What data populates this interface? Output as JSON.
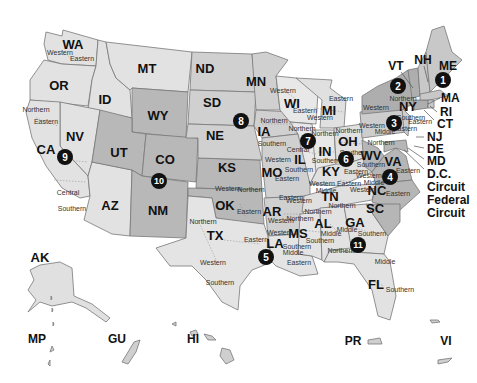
{
  "map": {
    "title": "United States Federal Judicial Circuits and Districts",
    "colors": {
      "background": "#ffffff",
      "light": "#e6e6e6",
      "medium": "#d2d2d2",
      "dark": "#b6b6b6",
      "circle": "#111111",
      "border": "#777777"
    },
    "circuits": [
      {
        "number": "1",
        "states": [
          "ME",
          "NH",
          "MA",
          "RI"
        ]
      },
      {
        "number": "2",
        "states": [
          "VT",
          "NY",
          "CT"
        ]
      },
      {
        "number": "3",
        "states": [
          "PA",
          "NJ",
          "DE"
        ]
      },
      {
        "number": "4",
        "states": [
          "MD",
          "WV",
          "VA",
          "NC",
          "SC"
        ]
      },
      {
        "number": "5",
        "states": [
          "TX",
          "LA",
          "MS"
        ]
      },
      {
        "number": "6",
        "states": [
          "MI",
          "OH",
          "KY",
          "TN"
        ]
      },
      {
        "number": "7",
        "states": [
          "WI",
          "IL",
          "IN"
        ]
      },
      {
        "number": "8",
        "states": [
          "ND",
          "SD",
          "NE",
          "MN",
          "IA",
          "MO",
          "AR"
        ]
      },
      {
        "number": "9",
        "states": [
          "WA",
          "OR",
          "ID",
          "MT",
          "NV",
          "CA",
          "AZ",
          "AK",
          "HI",
          "GU",
          "MP"
        ]
      },
      {
        "number": "10",
        "states": [
          "WY",
          "UT",
          "CO",
          "KS",
          "OK",
          "NM"
        ]
      },
      {
        "number": "11",
        "states": [
          "AL",
          "GA",
          "FL"
        ]
      }
    ],
    "state_labels": {
      "WA": "WA",
      "OR": "OR",
      "ID": "ID",
      "MT": "MT",
      "WY": "WY",
      "NV": "NV",
      "CA": "CA",
      "UT": "UT",
      "CO": "CO",
      "AZ": "AZ",
      "NM": "NM",
      "ND": "ND",
      "SD": "SD",
      "NE": "NE",
      "KS": "KS",
      "OK": "OK",
      "TX": "TX",
      "MN": "MN",
      "IA": "IA",
      "MO": "MO",
      "AR": "AR",
      "LA": "LA",
      "WI": "WI",
      "IL": "IL",
      "MI": "MI",
      "IN": "IN",
      "OH": "OH",
      "KY": "KY",
      "TN": "TN",
      "MS": "MS",
      "AL": "AL",
      "GA": "GA",
      "FL": "FL",
      "SC": "SC",
      "NC": "NC",
      "VA": "VA",
      "WV": "WV",
      "NY": "NY",
      "ME": "ME",
      "AK": "AK"
    },
    "callout_labels": {
      "VT": "VT",
      "NH": "NH",
      "ME": "ME",
      "MA": "MA",
      "RI": "RI",
      "CT": "CT",
      "NJ": "NJ",
      "DE": "DE",
      "MD": "MD",
      "DC": "D.C.",
      "dc_circuit": "Circuit",
      "federal": "Federal",
      "federal_circuit": "Circuit"
    },
    "territories": {
      "MP": "MP",
      "GU": "GU",
      "HI": "HI",
      "PR": "PR",
      "VI": "VI"
    },
    "district_labels": {
      "wa_w": "Western",
      "wa_e": "Eastern",
      "ca_n": "Northern",
      "ca_e": "Eastern",
      "ca_c": "Central",
      "ca_s": "Southern",
      "ia_n": "Northern",
      "ia_s": "Southern",
      "wi_w": "Western",
      "wi_e": "Eastern",
      "mi_e": "Eastern",
      "mi_w": "Western",
      "il_n": "Northern",
      "il_c": "Central",
      "il_s": "Southern",
      "in_n": "Northern",
      "in_s": "Southern",
      "oh_n": "Northern",
      "oh_s": "Southern",
      "ny_n": "Northern",
      "ny_w": "Western",
      "ny_s": "Southern",
      "ny_e": "Eastern",
      "pa_w": "Western",
      "pa_m": "Middle",
      "pa_e": "Eastern",
      "wv_n": "Northern",
      "wv_s": "Southern",
      "va_w": "Western",
      "va_e": "Eastern",
      "nc_m": "Middle",
      "nc_e": "Eastern",
      "nc_w": "Western",
      "mo_w": "Western",
      "mo_e": "Eastern",
      "ky_e": "Eastern",
      "ky_w": "Western",
      "tn_m": "Middle",
      "tn_e": "Eastern",
      "tn_w": "Western",
      "ok_w": "Western",
      "ok_n": "Northern",
      "ok_e": "Eastern",
      "ar_e": "Eastern",
      "ar_w": "Western",
      "tx_n": "Northern",
      "tx_e": "Eastern",
      "tx_w": "Western",
      "tx_s": "Southern",
      "la_w": "Western",
      "la_m": "Middle",
      "la_e": "Eastern",
      "ms_n": "Northern",
      "ms_s": "Southern",
      "al_n": "Northern",
      "al_m": "Middle",
      "al_s": "Southern",
      "ga_n": "Northern",
      "ga_m": "Middle",
      "ga_s": "Southern",
      "fl_n": "Northern",
      "fl_m": "Middle",
      "fl_s": "Southern"
    }
  }
}
